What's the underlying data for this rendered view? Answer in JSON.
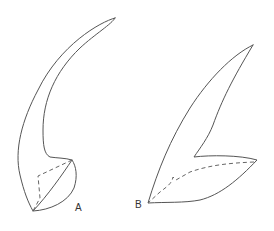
{
  "figure": {
    "panels": [
      {
        "id": "A",
        "label": "A",
        "description": "curved claw-shaped outline with dashed internal lines"
      },
      {
        "id": "B",
        "label": "B",
        "description": "wing/blade-shaped outline with dashed internal line"
      }
    ],
    "colors": {
      "line": "#555555",
      "background": "#ffffff"
    }
  }
}
